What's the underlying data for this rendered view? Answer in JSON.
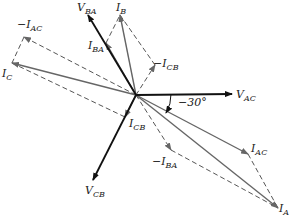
{
  "diagram": {
    "title": "",
    "type": "phasor-diagram",
    "origin": [
      136,
      95
    ],
    "angle_annotation": "−30°",
    "colors": {
      "voltage": "#111111",
      "current": "#777777",
      "construction": "#555555"
    },
    "labels": {
      "V_BA": {
        "main": "V",
        "sub": "BA"
      },
      "I_B": {
        "main": "I",
        "sub": "B"
      },
      "I_BA": {
        "main": "I",
        "sub": "BA"
      },
      "neg_I_AC": {
        "main": "−I",
        "sub": "AC"
      },
      "I_C": {
        "main": "I",
        "sub": "C"
      },
      "neg_I_CB": {
        "main": "−I",
        "sub": "CB"
      },
      "V_AC": {
        "main": "V",
        "sub": "AC"
      },
      "I_AC": {
        "main": "I",
        "sub": "AC"
      },
      "neg_I_BA": {
        "main": "−I",
        "sub": "BA"
      },
      "I_A": {
        "main": "I",
        "sub": "A"
      },
      "I_CB": {
        "main": "I",
        "sub": "CB"
      },
      "V_CB": {
        "main": "V",
        "sub": "CB"
      }
    }
  }
}
